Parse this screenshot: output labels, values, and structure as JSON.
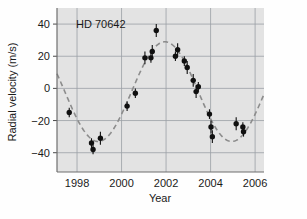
{
  "chart_data": {
    "type": "scatter",
    "title": "",
    "annotation": "HD 70642",
    "xlabel": "Year",
    "ylabel": "Radial velocity (m/s)",
    "xlim": [
      1997.1,
      2006.4
    ],
    "ylim": [
      -52,
      50
    ],
    "xticks": [
      1998,
      2000,
      2002,
      2004,
      2006
    ],
    "yticks": [
      40,
      20,
      0,
      -20,
      -40
    ],
    "xticklabels": [
      "1998",
      "2000",
      "2002",
      "2004",
      "2006"
    ],
    "yticklabels": [
      "40",
      "20",
      "0",
      "-20",
      "-40"
    ],
    "grid": true,
    "legend": "none",
    "plot_bgcolor": "#e3e3e3",
    "grid_color": "#9aa0a6",
    "point_color": "#101010",
    "fit_color": "#8c8c8c",
    "series": [
      {
        "name": "Radial velocity measurements",
        "marker": "filled-circle-with-errorbars",
        "points": [
          {
            "x": 1997.65,
            "y": -15,
            "err": 3
          },
          {
            "x": 1998.65,
            "y": -34,
            "err": 3
          },
          {
            "x": 1998.72,
            "y": -38,
            "err": 3
          },
          {
            "x": 1999.05,
            "y": -31,
            "err": 4
          },
          {
            "x": 2000.25,
            "y": -11,
            "err": 3
          },
          {
            "x": 2000.62,
            "y": -3,
            "err": 3
          },
          {
            "x": 2001.05,
            "y": 19,
            "err": 4
          },
          {
            "x": 2001.32,
            "y": 19,
            "err": 3
          },
          {
            "x": 2001.38,
            "y": 23,
            "err": 4
          },
          {
            "x": 2001.56,
            "y": 36,
            "err": 4
          },
          {
            "x": 2002.42,
            "y": 20,
            "err": 3
          },
          {
            "x": 2002.52,
            "y": 24,
            "err": 4
          },
          {
            "x": 2002.82,
            "y": 17,
            "err": 3
          },
          {
            "x": 2002.95,
            "y": 13,
            "err": 4
          },
          {
            "x": 2003.22,
            "y": 5,
            "err": 4
          },
          {
            "x": 2003.35,
            "y": -2,
            "err": 4
          },
          {
            "x": 2003.45,
            "y": 1,
            "err": 3
          },
          {
            "x": 2003.95,
            "y": -16,
            "err": 3
          },
          {
            "x": 2004.02,
            "y": -24,
            "err": 4
          },
          {
            "x": 2004.08,
            "y": -30,
            "err": 4
          },
          {
            "x": 2005.15,
            "y": -22,
            "err": 4
          },
          {
            "x": 2005.45,
            "y": -24,
            "err": 3
          },
          {
            "x": 2005.48,
            "y": -27,
            "err": 3
          }
        ]
      }
    ],
    "fit_curve": {
      "name": "Keplerian orbital fit",
      "style": "dashed",
      "model": "sinusoid",
      "amplitude": 31,
      "offset": -2,
      "period_years": 6.0,
      "phase_peak_year": 2001.95
    }
  }
}
